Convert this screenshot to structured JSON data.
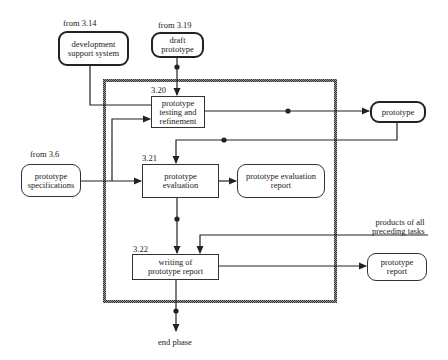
{
  "diagram": {
    "frame": {
      "label": "prototyping phase boundary"
    },
    "inputs": [
      {
        "id": "dev-support",
        "source": "from 3.14",
        "label": "development\nsupport system",
        "style": "thick-rounded"
      },
      {
        "id": "draft-prototype",
        "source": "from 3.19",
        "label": "draft\nprototype",
        "style": "thick-rounded"
      },
      {
        "id": "prototype-specs",
        "source": "from 3.6",
        "label": "prototype\nspecifications",
        "style": "rounded"
      },
      {
        "id": "preceding-products",
        "label": "products of all\npreceding tasks"
      }
    ],
    "tasks": [
      {
        "id": "3.20",
        "number": "3.20",
        "label": "prototype\ntesting and\nrefinement"
      },
      {
        "id": "3.21",
        "number": "3.21",
        "label": "prototype\nevaluation"
      },
      {
        "id": "3.22",
        "number": "3.22",
        "label": "writing of\nprototype report"
      }
    ],
    "outputs": [
      {
        "id": "prototype",
        "label": "prototype",
        "style": "thick-rounded"
      },
      {
        "id": "evaluation-report",
        "label": "prototype  evaluation\nreport",
        "style": "rounded"
      },
      {
        "id": "prototype-report",
        "label": "prototype\nreport",
        "style": "rounded"
      }
    ],
    "terminal": {
      "label": "end phase"
    }
  }
}
